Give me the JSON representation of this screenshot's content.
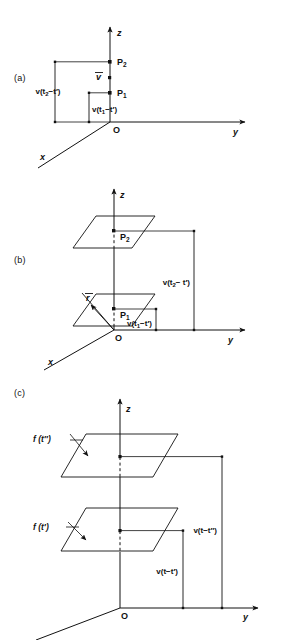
{
  "figure": {
    "type": "physics-diagram",
    "background_color": "#ffffff",
    "line_color": "#111111"
  },
  "panels": [
    {
      "id": "a",
      "label": "(a)",
      "axes": {
        "z": "z",
        "y": "y",
        "x": "x",
        "origin": "O"
      },
      "points": [
        {
          "name": "P2",
          "base": "P",
          "subscript": "2"
        },
        {
          "name": "P1",
          "base": "P",
          "subscript": "1"
        }
      ],
      "vector_label": {
        "base": "v",
        "overbar": true
      },
      "measures": [
        {
          "id": "m-a-outer",
          "prefix": "v(t",
          "subscript": "2",
          "suffix": "−t′)"
        },
        {
          "id": "m-a-inner",
          "prefix": "v(t",
          "subscript": "1",
          "suffix": "−t′)"
        }
      ]
    },
    {
      "id": "b",
      "label": "(b)",
      "axes": {
        "z": "z",
        "y": "y",
        "x": "x",
        "origin": "O"
      },
      "points": [
        {
          "name": "P2",
          "base": "P",
          "subscript": "2"
        },
        {
          "name": "P1",
          "base": "P",
          "subscript": "1"
        }
      ],
      "vector_label": {
        "base": "r",
        "overbar": true
      },
      "measures": [
        {
          "id": "m-b-outer",
          "prefix": "v(t",
          "subscript": "2",
          "suffix": "− t′)"
        },
        {
          "id": "m-b-inner",
          "prefix": "v(t",
          "subscript": "1",
          "suffix": "−t′)"
        }
      ],
      "planes": 2
    },
    {
      "id": "c",
      "label": "(c)",
      "axes": {
        "z": "z",
        "y": "y",
        "x": "",
        "origin": "O"
      },
      "plane_labels": [
        {
          "id": "f-tpp",
          "text": "f (t″)"
        },
        {
          "id": "f-tp",
          "text": "f (t′)"
        }
      ],
      "measures": [
        {
          "id": "m-c-outer",
          "text": "v(t−t″)"
        },
        {
          "id": "m-c-inner",
          "text": "v(t−t′)"
        }
      ],
      "planes": 2
    }
  ]
}
